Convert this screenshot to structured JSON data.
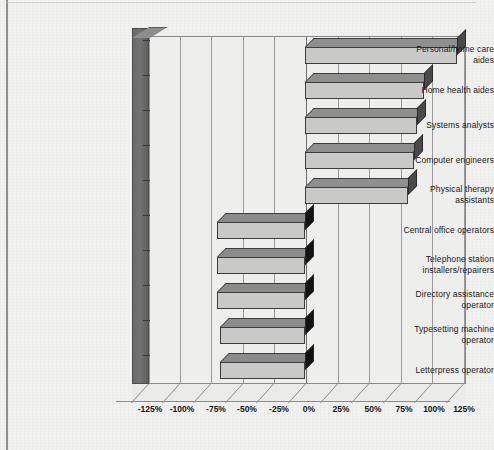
{
  "chart_data": {
    "type": "bar",
    "orientation": "horizontal",
    "title": "",
    "subtitle": "",
    "xlabel": "",
    "ylabel": "",
    "xlim": [
      -137.5,
      137.5
    ],
    "grid": true,
    "legend": null,
    "style": "3d-horizontal-bar",
    "axis_tick_labels": [
      "-125%",
      "-100%",
      "-75%",
      "-50%",
      "-25%",
      "0%",
      "25%",
      "50%",
      "75%",
      "100%",
      "125%"
    ],
    "axis_tick_values": [
      -125,
      -100,
      -75,
      -50,
      -25,
      0,
      25,
      50,
      75,
      100,
      125
    ],
    "categories": [
      "Personal/home care aides",
      "Home health aides",
      "Systems analysts",
      "Computer engineers",
      "Physical therapy assistants",
      "Central office operators",
      "Telephone station installers/repairers",
      "Directory assistance operator",
      "Typesetting machine operator",
      "Letterpress operator"
    ],
    "values": [
      125,
      98,
      92,
      90,
      85,
      -70,
      -70,
      -70,
      -68,
      -68
    ],
    "value_labels": [
      "125%",
      "98%",
      "92%",
      "90%",
      "85%",
      "-70%",
      "-70%",
      "-70%",
      "-68%",
      "-68%"
    ],
    "colors": {
      "bar_face": "#c9c9c7",
      "bar_top": "#8f8f8f",
      "bar_side_positive": "#4a4a4a",
      "bar_side_negative": "#121212",
      "plot_background": "#eeeeec",
      "page_background": "#f1f1ef",
      "gridline": "#9a9a9a",
      "axis_wall": "#6e6e6e",
      "text": "#1b1b1b"
    }
  },
  "categories_multiline": [
    [
      "Personal/home care",
      "aides"
    ],
    [
      "Home health aides"
    ],
    [
      "Systems analysts"
    ],
    [
      "Computer engineers"
    ],
    [
      "Physical therapy",
      "assistants"
    ],
    [
      "Central office operators"
    ],
    [
      "Telephone station",
      "installers/repairers"
    ],
    [
      "Directory assistance",
      "operator"
    ],
    [
      "Typesetting machine",
      "operator"
    ],
    [
      "Letterpress operator"
    ]
  ],
  "cat0_line0": "Personal/home care",
  "cat0_line1": "aides",
  "cat1_line0": "Home health aides",
  "cat2_line0": "Systems analysts",
  "cat3_line0": "Computer engineers",
  "cat4_line0": "Physical therapy",
  "cat4_line1": "assistants",
  "cat5_line0": "Central office operators",
  "cat6_line0": "Telephone station",
  "cat6_line1": "installers/repairers",
  "cat7_line0": "Directory assistance",
  "cat7_line1": "operator",
  "cat8_line0": "Typesetting machine",
  "cat8_line1": "operator",
  "cat9_line0": "Letterpress operator",
  "xtick0": "-125%",
  "xtick1": "-100%",
  "xtick2": "-75%",
  "xtick3": "-50%",
  "xtick4": "-25%",
  "xtick5": "0%",
  "xtick6": "25%",
  "xtick7": "50%",
  "xtick8": "75%",
  "xtick9": "100%",
  "xtick10": "125%"
}
